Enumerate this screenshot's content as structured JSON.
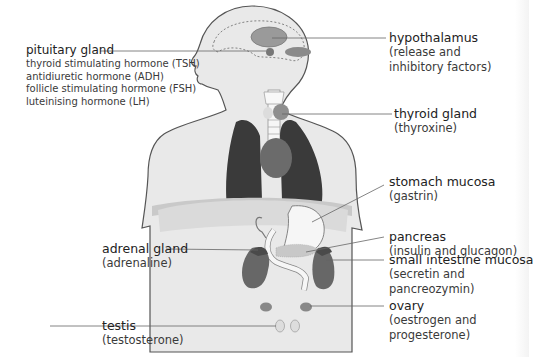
{
  "diagram": {
    "colors": {
      "body_fill": "#e9e9e9",
      "outline": "#555555",
      "lung": "#3a3a3a",
      "heart": "#6b6b6b",
      "kidney": "#676767",
      "gland": "#8c8c8c",
      "organ_light": "#f6f6f6",
      "leader_line": "#666666"
    },
    "labels": {
      "pituitary": {
        "title": "pituitary gland",
        "hormones": [
          "thyroid stimulating hormone (TSH)",
          "antidiuretic hormone (ADH)",
          "follicle stimulating hormone (FSH)",
          "luteinising hormone (LH)"
        ]
      },
      "hypothalamus": {
        "title": "hypothalamus",
        "line1": "(release and",
        "line2": "inhibitory factors)"
      },
      "thyroid": {
        "title": "thyroid gland",
        "line1": "(thyroxine)"
      },
      "stomach": {
        "title": "stomach mucosa",
        "line1": "(gastrin)"
      },
      "pancreas": {
        "title": "pancreas",
        "line1": "(insulin and glucagon)"
      },
      "adrenal": {
        "title": "adrenal gland",
        "line1": "(adrenaline)"
      },
      "small_intestine": {
        "title": "small intestine mucosa",
        "line1": "(secretin and",
        "line2": "pancreozymin)"
      },
      "ovary": {
        "title": "ovary",
        "line1": "(oestrogen and",
        "line2": "progesterone)"
      },
      "testis": {
        "title": "testis",
        "line1": "(testosterone)"
      }
    }
  }
}
